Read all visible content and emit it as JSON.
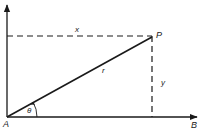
{
  "diagram": {
    "points": {
      "origin": "A",
      "axis_end": "B",
      "point": "P"
    },
    "labels": {
      "horizontal_component": "x",
      "vertical_component": "y",
      "radius": "r",
      "angle": "θ",
      "origin": "A",
      "axis_end": "B",
      "point": "P"
    },
    "colors": {
      "line": "#1a1a1a",
      "background": "#ffffff"
    }
  }
}
